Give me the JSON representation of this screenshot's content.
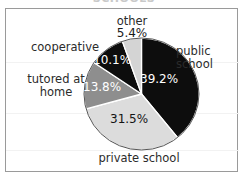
{
  "title": "SCHOOLS",
  "frame": {
    "border_color": "#9a9a9a",
    "background": "#ffffff"
  },
  "chart_data": {
    "type": "pie",
    "title": "SCHOOLS",
    "xlabel": "",
    "ylabel": "",
    "start_angle_deg": 0,
    "direction": "clockwise",
    "legend_position": "labels-around-slices",
    "grid": false,
    "categories": [
      "public school",
      "private school",
      "tutored at home",
      "cooperative",
      "other"
    ],
    "values": [
      39.2,
      31.5,
      13.8,
      10.1,
      5.4
    ],
    "value_suffix": "%",
    "colors": [
      "#0d0d0d",
      "#dcdcdc",
      "#8e8e8e",
      "#0d0d0d",
      "#d4d4d4"
    ],
    "slices": [
      {
        "label": "public school",
        "label_line1": "public",
        "label_line2": "school",
        "value": 39.2,
        "value_text": "39.2%",
        "color": "#0d0d0d",
        "value_text_color": "#ffffff"
      },
      {
        "label": "private school",
        "label_line1": "private school",
        "label_line2": "",
        "value": 31.5,
        "value_text": "31.5%",
        "color": "#dcdcdc",
        "value_text_color": "#141414"
      },
      {
        "label": "tutored at home",
        "label_line1": "tutored at",
        "label_line2": "home",
        "value": 13.8,
        "value_text": "13.8%",
        "color": "#8e8e8e",
        "value_text_color": "#ffffff"
      },
      {
        "label": "cooperative",
        "label_line1": "cooperative",
        "label_line2": "",
        "value": 10.1,
        "value_text": "10.1%",
        "color": "#0d0d0d",
        "value_text_color": "#ffffff"
      },
      {
        "label": "other",
        "label_line1": "other",
        "label_line2": "",
        "value": 5.4,
        "value_text": "5.4%",
        "color": "#d4d4d4",
        "value_text_color": "#1a1a1a"
      }
    ]
  }
}
